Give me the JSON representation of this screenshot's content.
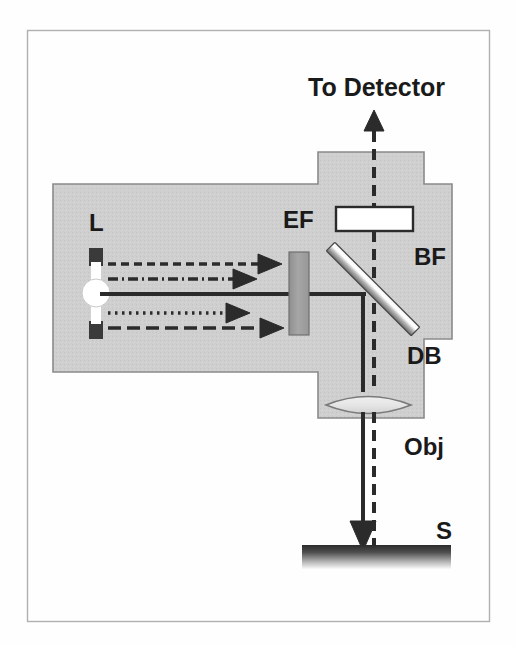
{
  "figure": {
    "frame": {
      "border_color": "#a8a8a8",
      "background_color": "#fefefe",
      "x": 27,
      "y": 30,
      "width": 463,
      "height": 592
    },
    "housing": {
      "name": "microscope-housing",
      "fill_color": "#cfcfcf",
      "stroke_color": "#7a7a7a"
    },
    "labels": [
      {
        "id": "to-detector",
        "text": "To Detector",
        "x": 308,
        "y": 96,
        "size": "lbl-big"
      },
      {
        "id": "lamp",
        "text": "L",
        "x": 89,
        "y": 231,
        "size": "lbl-med"
      },
      {
        "id": "ex-filter",
        "text": "EF",
        "x": 283,
        "y": 228,
        "size": "lbl-med"
      },
      {
        "id": "bar-filter",
        "text": "BF",
        "x": 414,
        "y": 265,
        "size": "lbl-med"
      },
      {
        "id": "dichroic",
        "text": "DB",
        "x": 407,
        "y": 364,
        "size": "lbl-med"
      },
      {
        "id": "objective",
        "text": "Obj",
        "x": 404,
        "y": 455,
        "size": "lbl-med"
      },
      {
        "id": "specimen",
        "text": "S",
        "x": 436,
        "y": 539,
        "size": "lbl-med"
      }
    ],
    "components": {
      "lamp": {
        "name": "light-source-lamp",
        "bulb_color": "#ffffff",
        "cap_color": "#3a3a3a",
        "cx": 96,
        "cy": 293,
        "r": 12
      },
      "excitation_filter": {
        "name": "excitation-filter",
        "fill_color": "#9e9e9e",
        "stroke_color": "#6e6e6e",
        "x": 289,
        "y": 252,
        "width": 19,
        "height": 82
      },
      "barrier_filter": {
        "name": "barrier-filter",
        "fill_color": "#ffffff",
        "stroke_color": "#2b2b2b",
        "x": 336,
        "y": 207,
        "width": 76,
        "height": 24
      },
      "dichroic_beamsplitter": {
        "name": "dichroic-beamsplitter",
        "fill_color_light": "#ffffff",
        "fill_color_dark": "#707070",
        "x1": 332,
        "y1": 248,
        "x2": 414,
        "y2": 330,
        "thickness": 11
      },
      "objective": {
        "name": "objective-lens",
        "fill_color": "#e2e2e2",
        "stroke_color": "#6e6e6e",
        "cx": 368,
        "cy": 405,
        "width": 86,
        "height": 26
      },
      "specimen": {
        "name": "specimen-slide",
        "gradient_top": "#2d2d2d",
        "gradient_bottom": "#f2f2f2",
        "x": 302,
        "y": 544,
        "width": 148,
        "height": 24
      }
    },
    "beams": {
      "excitation_color": "#2b2b2b",
      "lines": [
        {
          "id": "beam-dashed-upper",
          "style": "dashed",
          "y": 264,
          "x_start": 108,
          "x_end": 260,
          "arrow_x": 276
        },
        {
          "id": "beam-dashdot-upper",
          "style": "dash-dot",
          "y": 279,
          "x_start": 108,
          "x_end": 235,
          "arrow_x": 251
        },
        {
          "id": "beam-solid-axis",
          "style": "solid",
          "y": 294,
          "x_start": 108,
          "x_end": 365,
          "arrow_x": null
        },
        {
          "id": "beam-dotted-lower",
          "style": "dotted",
          "y": 313,
          "x_start": 108,
          "x_end": 228,
          "arrow_x": 244
        },
        {
          "id": "beam-dashed-lower",
          "style": "longdash",
          "y": 328,
          "x_start": 108,
          "x_end": 262,
          "arrow_x": 278
        }
      ],
      "vertical": [
        {
          "id": "emission-dashed-up",
          "style": "dashed",
          "x": 374,
          "y_start": 118,
          "y_end": 207,
          "arrow": "up"
        },
        {
          "id": "emission-dashed-mid",
          "style": "dashed",
          "x": 374,
          "y_start": 231,
          "y_end": 540,
          "arrow": "none"
        },
        {
          "id": "excitation-down-solid",
          "style": "solid",
          "x": 363,
          "y_start": 294,
          "y_end": 540,
          "arrow": "down"
        }
      ]
    }
  }
}
